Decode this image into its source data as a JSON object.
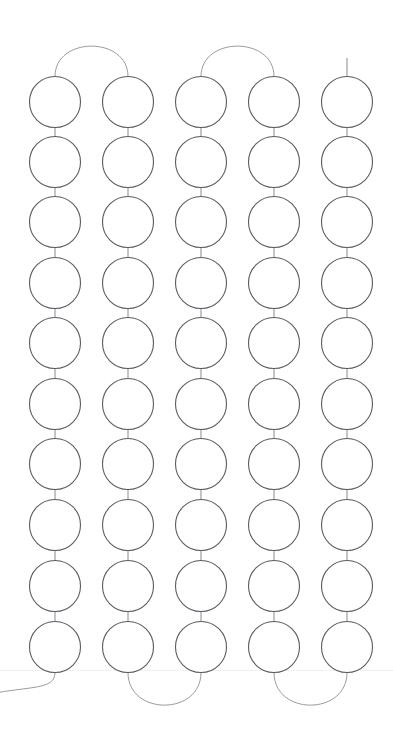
{
  "diagram": {
    "type": "node-link-chain",
    "canvas": {
      "width": 393,
      "height": 747,
      "background": "#ffffff"
    },
    "style": {
      "node_stroke": "#5a5a62",
      "node_fill": "#ffffff",
      "node_stroke_width": 1.1,
      "link_stroke": "#8a8a92",
      "link_stroke_width": 1,
      "arc_stroke": "#9a9aa2",
      "baseline_stroke": "#f1f0f2"
    },
    "grid": {
      "columns": 5,
      "rows": 10,
      "node_count": 50,
      "node_radius": 25.5,
      "column_centers_x": [
        55,
        128,
        201,
        274,
        347
      ],
      "row_centers_y": [
        102,
        162,
        222,
        283,
        343,
        404,
        464,
        525,
        586,
        647
      ],
      "column_spacing": 73,
      "row_spacing": 60.5
    },
    "vertical_links": {
      "description": "straight segment joining consecutive nodes within a column",
      "count_per_column": 9,
      "total": 45
    },
    "top_arcs": [
      {
        "from_column": 1,
        "to_column": 2,
        "peak_y": 44
      },
      {
        "from_column": 3,
        "to_column": 4,
        "peak_y": 44
      }
    ],
    "bottom_arcs": [
      {
        "from_column": 2,
        "to_column": 3,
        "trough_y": 707
      },
      {
        "from_column": 4,
        "to_column": 5,
        "trough_y": 707
      }
    ],
    "open_leads": [
      {
        "id": "top-lead",
        "column": 5,
        "kind": "vertical-stub",
        "from_y": 58,
        "to_y": 77
      },
      {
        "id": "bottom-lead",
        "column": 1,
        "kind": "curve-off-left",
        "to_x": -8,
        "to_y": 692
      }
    ],
    "baseline": {
      "y": 670,
      "x_start": 0,
      "x_end": 393
    }
  },
  "labels": {
    "node_label_prefix": "",
    "visible_text": ""
  }
}
